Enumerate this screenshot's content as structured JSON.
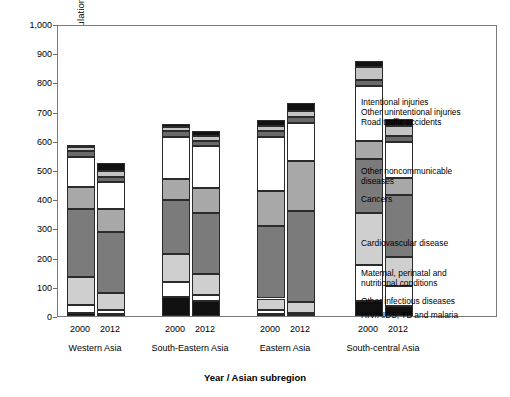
{
  "chart_data": {
    "type": "bar",
    "subtype": "stacked-vertical-grouped",
    "title": "",
    "xlabel": "Year / Asian subregion",
    "ylabel": "Death rate per 100,000 population",
    "ylim": [
      0,
      1000
    ],
    "yticks": [
      "0",
      "100",
      "200",
      "300",
      "400",
      "500",
      "600",
      "700",
      "800",
      "900",
      "1,000"
    ],
    "grid": false,
    "legend_position": "right-outside",
    "categories": [
      "Western Asia 2000",
      "Western Asia 2012",
      "South-Eastern Asia 2000",
      "South-Eastern Asia 2012",
      "Eastern Asia 2000",
      "Eastern Asia 2012",
      "South-central Asia 2000",
      "South-central Asia 2012"
    ],
    "groups": [
      {
        "name": "Western Asia",
        "years": [
          "2000",
          "2012"
        ]
      },
      {
        "name": "South-Eastern Asia",
        "years": [
          "2000",
          "2012"
        ]
      },
      {
        "name": "Eastern Asia",
        "years": [
          "2000",
          "2012"
        ]
      },
      {
        "name": "South-central Asia",
        "years": [
          "2000",
          "2012"
        ]
      }
    ],
    "series": [
      {
        "name": "HIV/AIDS, TB and malaria",
        "color": "#111111",
        "values": [
          9,
          7,
          66,
          52,
          8,
          5,
          52,
          35
        ]
      },
      {
        "name": "Other infectious  diseases",
        "color": "#ffffff",
        "values": [
          28,
          14,
          52,
          20,
          12,
          6,
          122,
          67
        ]
      },
      {
        "name": "Maternal, perinatal and\nnutritional conditions",
        "color": "#cfcfcf",
        "values": [
          96,
          57,
          95,
          72,
          40,
          36,
          178,
          101
        ]
      },
      {
        "name": "Cardiovascular disease",
        "color": "#7b7b7b",
        "values": [
          232,
          211,
          183,
          210,
          248,
          312,
          187,
          211
        ]
      },
      {
        "name": "Cancers",
        "color": "#a8a8a8",
        "values": [
          77,
          78,
          73,
          85,
          120,
          171,
          60,
          57
        ]
      },
      {
        "name": "Other noncommunicable\ndiseases",
        "color": "#ffffff",
        "values": [
          104,
          93,
          145,
          143,
          186,
          131,
          189,
          125
        ]
      },
      {
        "name": "Road traffic accidents",
        "color": "#6a6a6a",
        "values": [
          18,
          17,
          20,
          18,
          20,
          21,
          20,
          20
        ]
      },
      {
        "name": "Other unintentional injuries",
        "color": "#c4c4c4",
        "values": [
          14,
          18,
          14,
          17,
          18,
          21,
          45,
          36
        ]
      },
      {
        "name": "Intentional injuries",
        "color": "#111111",
        "values": [
          9,
          29,
          10,
          17,
          20,
          26,
          19,
          24
        ]
      }
    ],
    "totals": [
      587,
      524,
      658,
      634,
      672,
      729,
      872,
      676
    ]
  },
  "axis": {
    "y_title": "Death rate per 100,000 population",
    "x_title": "Year / Asian subregion"
  },
  "legend": {
    "items": [
      {
        "label": "Intentional injuries"
      },
      {
        "label": "Other unintentional injuries"
      },
      {
        "label": "Road traffic accidents"
      },
      {
        "label": "Other noncommunicable\ndiseases"
      },
      {
        "label": "Cancers"
      },
      {
        "label": "Cardiovascular disease"
      },
      {
        "label": "Maternal, perinatal and\n     nutritional conditions"
      },
      {
        "label": "Other infectious  diseases"
      },
      {
        "label": "HIV/AIDS, TB and malaria"
      }
    ]
  }
}
